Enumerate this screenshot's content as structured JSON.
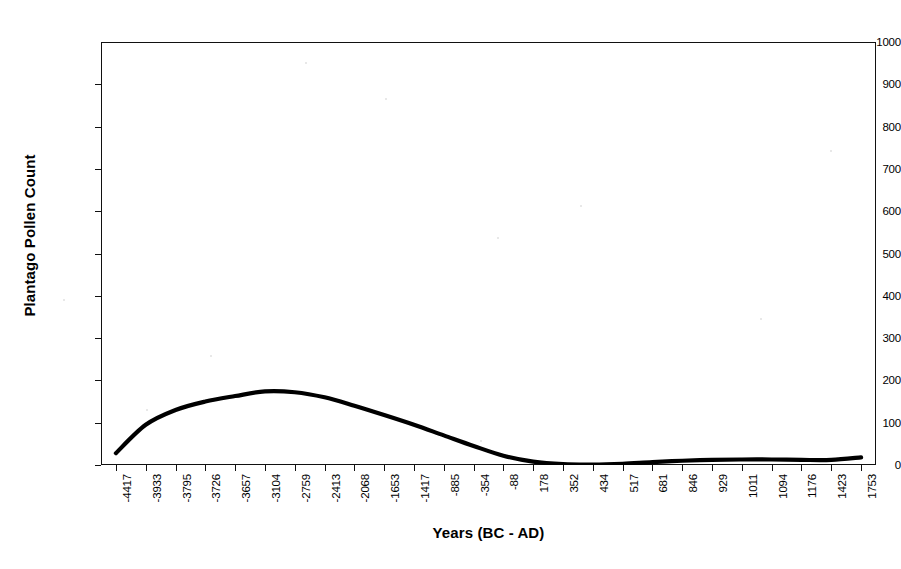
{
  "chart_data": {
    "type": "line",
    "title": "",
    "xlabel": "Years (BC - AD)",
    "ylabel": "Plantago Pollen Count",
    "ylim": [
      0,
      1000
    ],
    "ytick_labels": [
      "1000",
      "900",
      "800",
      "700",
      "600",
      "500",
      "400",
      "300",
      "200",
      "100",
      "0"
    ],
    "ytick_values": [
      1000,
      900,
      800,
      700,
      600,
      500,
      400,
      300,
      200,
      100,
      0
    ],
    "grid": false,
    "legend": "none",
    "categories": [
      "-4417",
      "-3933",
      "-3795",
      "-3726",
      "-3657",
      "-3104",
      "-2759",
      "-2413",
      "-2068",
      "-1653",
      "-1417",
      "-885",
      "-354",
      "-88",
      "178",
      "352",
      "434",
      "517",
      "681",
      "846",
      "929",
      "1011",
      "1094",
      "1176",
      "1423",
      "1753"
    ],
    "x_tick_labels": [
      "-4417",
      "-3933",
      "-3795",
      "-3726",
      "-3657",
      "-3104",
      "-2759",
      "-2413",
      "-2068",
      "-1653",
      "-1417",
      "-885",
      "-354",
      "-88",
      "178",
      "352",
      "434",
      "517",
      "681",
      "846",
      "929",
      "1011",
      "1094",
      "1176",
      "1423",
      "1753"
    ],
    "series": [
      {
        "name": "Plantago Pollen Count",
        "color": "#000000",
        "values": [
          28,
          95,
          130,
          150,
          163,
          174,
          172,
          160,
          140,
          118,
          95,
          70,
          45,
          22,
          8,
          2,
          1,
          3,
          7,
          10,
          12,
          13,
          13,
          12,
          12,
          18
        ]
      }
    ]
  },
  "axes": {
    "x_title": "Years (BC - AD)",
    "y_title": "Plantago Pollen Count"
  },
  "style": {
    "line_color": "#000000",
    "frame_color": "#111111",
    "background": "#ffffff"
  }
}
